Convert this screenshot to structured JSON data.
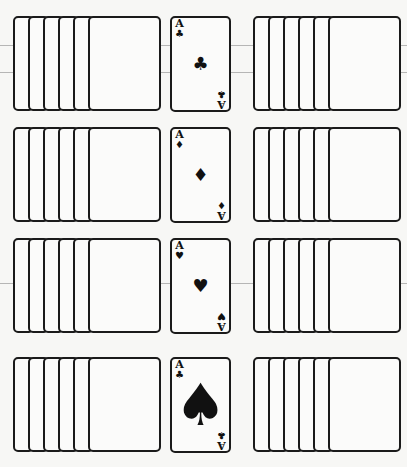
{
  "layout": {
    "description": "Solitaire layout: four rows, each with a fanned face-down pile on the left, an ace in the center, and a fanned face-down pile on the right",
    "rows": [
      {
        "left_pile": {
          "card_count": 6
        },
        "ace": {
          "rank": "A",
          "suit": "clubs",
          "suit_symbol": "♣",
          "center_symbol": "♣",
          "large_center": false
        },
        "right_pile": {
          "card_count": 6
        }
      },
      {
        "left_pile": {
          "card_count": 6
        },
        "ace": {
          "rank": "A",
          "suit": "diamonds",
          "suit_symbol": "♦",
          "center_symbol": "♦",
          "large_center": false
        },
        "right_pile": {
          "card_count": 6
        }
      },
      {
        "left_pile": {
          "card_count": 6
        },
        "ace": {
          "rank": "A",
          "suit": "hearts",
          "suit_symbol": "♥",
          "center_symbol": "♥",
          "large_center": false
        },
        "right_pile": {
          "card_count": 6
        }
      },
      {
        "left_pile": {
          "card_count": 6
        },
        "ace": {
          "rank": "A",
          "suit": "spades",
          "suit_symbol": "♣",
          "center_symbol": "♠",
          "large_center": true
        },
        "right_pile": {
          "card_count": 6
        }
      }
    ]
  },
  "colors": {
    "ink": "#1a1a1a",
    "paper": "#f7f7f5"
  }
}
